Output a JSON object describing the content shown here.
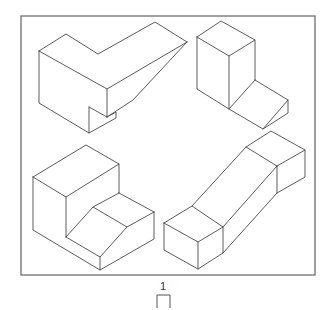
{
  "figure": {
    "frame": {
      "x": 21,
      "y": 16,
      "width": 294,
      "height": 259
    },
    "stroke_color": "#4a4a4a",
    "frame_color": "#6e6e6e",
    "label": "1",
    "objects": [
      {
        "name": "top-left-object",
        "description": "L-shaped block with tapered arm and notch",
        "lines": [
          [
            [
              39,
              51
            ],
            [
              66,
              34
            ],
            [
              98,
              54
            ],
            [
              155,
              22
            ],
            [
              187,
              42
            ]
          ],
          [
            [
              39,
              51
            ],
            [
              107,
              89
            ],
            [
              187,
              42
            ]
          ],
          [
            [
              39,
              51
            ],
            [
              39,
              103
            ],
            [
              89,
              133
            ],
            [
              116,
              118
            ],
            [
              116,
              112
            ],
            [
              107,
              117
            ]
          ],
          [
            [
              107,
              89
            ],
            [
              107,
              117
            ]
          ],
          [
            [
              89,
              107
            ],
            [
              89,
              133
            ]
          ],
          [
            [
              89,
              107
            ],
            [
              107,
              117
            ]
          ],
          [
            [
              107,
              117
            ],
            [
              133,
              100
            ],
            [
              187,
              42
            ]
          ]
        ]
      },
      {
        "name": "top-right-object",
        "description": "Tall block with wedge step",
        "lines": [
          [
            [
              197,
              37
            ],
            [
              221,
              21
            ],
            [
              255,
              40
            ],
            [
              229,
              56
            ],
            [
              197,
              37
            ]
          ],
          [
            [
              197,
              37
            ],
            [
              197,
              89
            ],
            [
              229,
              109
            ],
            [
              229,
              56
            ]
          ],
          [
            [
              255,
              40
            ],
            [
              255,
              80
            ]
          ],
          [
            [
              255,
              80
            ],
            [
              288,
              100
            ],
            [
              288,
              113
            ],
            [
              263,
              129
            ],
            [
              229,
              109
            ]
          ],
          [
            [
              229,
              109
            ],
            [
              255,
              80
            ]
          ],
          [
            [
              263,
              129
            ],
            [
              288,
              100
            ]
          ]
        ]
      },
      {
        "name": "bottom-left-object",
        "description": "Stepped block with chamfered lower step",
        "lines": [
          [
            [
              33,
              177
            ],
            [
              86,
              145
            ],
            [
              119,
              164
            ],
            [
              66,
              197
            ],
            [
              33,
              177
            ]
          ],
          [
            [
              33,
              177
            ],
            [
              33,
              230
            ],
            [
              100,
              270
            ],
            [
              154,
              239
            ],
            [
              154,
              212
            ]
          ],
          [
            [
              66,
              197
            ],
            [
              66,
              237
            ]
          ],
          [
            [
              119,
              164
            ],
            [
              119,
              193
            ]
          ],
          [
            [
              119,
              193
            ],
            [
              154,
              212
            ]
          ],
          [
            [
              119,
              193
            ],
            [
              93,
              207
            ]
          ],
          [
            [
              66,
              237
            ],
            [
              93,
              207
            ],
            [
              127,
              227
            ],
            [
              154,
              212
            ]
          ],
          [
            [
              66,
              237
            ],
            [
              100,
              257
            ],
            [
              127,
              227
            ]
          ],
          [
            [
              100,
              257
            ],
            [
              100,
              270
            ]
          ]
        ]
      },
      {
        "name": "bottom-right-object",
        "description": "Ramp block connecting low and high boxes",
        "lines": [
          [
            [
              164,
              223
            ],
            [
              192,
              206
            ],
            [
              223,
              227
            ],
            [
              198,
              242
            ],
            [
              164,
              223
            ]
          ],
          [
            [
              164,
              223
            ],
            [
              164,
              250
            ],
            [
              198,
              269
            ],
            [
              223,
              253
            ],
            [
              223,
              227
            ]
          ],
          [
            [
              198,
              242
            ],
            [
              198,
              269
            ]
          ],
          [
            [
              192,
              206
            ],
            [
              246,
              147
            ],
            [
              271,
              131
            ],
            [
              305,
              150
            ],
            [
              277,
              166
            ],
            [
              223,
              227
            ]
          ],
          [
            [
              246,
              147
            ],
            [
              277,
              166
            ]
          ],
          [
            [
              305,
              150
            ],
            [
              305,
              177
            ],
            [
              277,
              193
            ],
            [
              223,
              253
            ]
          ],
          [
            [
              277,
              166
            ],
            [
              277,
              193
            ]
          ]
        ]
      }
    ]
  }
}
